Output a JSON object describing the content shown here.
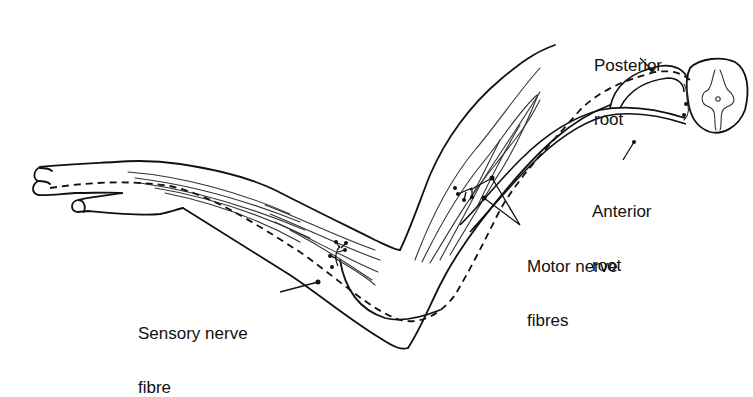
{
  "diagram": {
    "labels": {
      "posterior_root": {
        "line1": "Posterior",
        "line2": "root"
      },
      "anterior_root": {
        "line1": "Anterior",
        "line2": "root"
      },
      "motor_nerve_fibres": {
        "line1": "Motor nerve",
        "line2": "fibres"
      },
      "sensory_nerve_fibre": {
        "line1": "Sensory nerve",
        "line2": "fibre"
      }
    },
    "parts": [
      "hand",
      "forearm",
      "elbow",
      "upper-arm",
      "shoulder",
      "spinal-cord-section"
    ],
    "colors": {
      "ink": "#111111",
      "background": "#ffffff"
    }
  }
}
